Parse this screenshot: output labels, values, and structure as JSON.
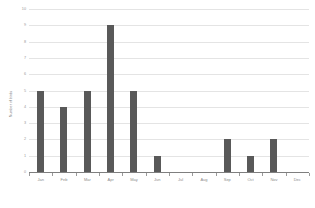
{
  "chart_data": {
    "type": "bar",
    "title": "",
    "xlabel": "",
    "ylabel": "Number of birds",
    "categories": [
      "Jan",
      "Feb",
      "Mar",
      "Apr",
      "May",
      "Jun",
      "Jul",
      "Aug",
      "Sep",
      "Oct",
      "Nov",
      "Dec"
    ],
    "values": [
      5,
      4,
      5,
      9,
      5,
      1,
      0,
      0,
      2,
      1,
      2,
      0
    ],
    "ylim": [
      0,
      10
    ],
    "ytick_labels": [
      "0",
      "1",
      "2",
      "3",
      "4",
      "5",
      "6",
      "7",
      "8",
      "9",
      "10"
    ],
    "ytick_values": [
      0,
      1,
      2,
      3,
      4,
      5,
      6,
      7,
      8,
      9,
      10
    ],
    "grid": "horizontal",
    "legend": "none",
    "series_color": "#595959",
    "gridline_color": "#e4e4e4",
    "axis_color": "#7f7f7f",
    "tick_label_color": "#9a9a9a"
  }
}
